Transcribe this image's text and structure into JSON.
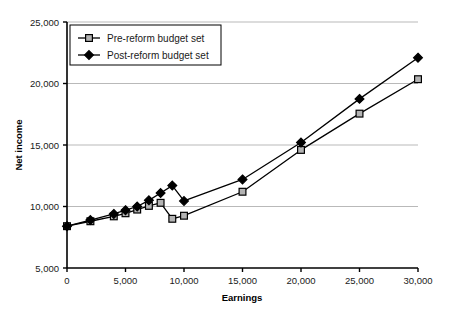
{
  "chart_data": {
    "type": "line",
    "title": "",
    "xlabel": "Earnings",
    "ylabel": "Net income",
    "xlim": [
      0,
      30000
    ],
    "ylim": [
      5000,
      25000
    ],
    "xticks": [
      0,
      5000,
      10000,
      15000,
      20000,
      25000,
      30000
    ],
    "xtick_labels": [
      "0",
      "5,000",
      "10,000",
      "15,000",
      "20,000",
      "25,000",
      "30,000"
    ],
    "yticks": [
      5000,
      10000,
      15000,
      20000,
      25000
    ],
    "ytick_labels": [
      "5,000",
      "10,000",
      "15,000",
      "20,000",
      "25,000"
    ],
    "grid": "horizontal",
    "legend_position": "top-left",
    "series": [
      {
        "name": "Pre-reform budget set",
        "marker": "square",
        "marker_fill": "#b3b3b3",
        "marker_stroke": "#000000",
        "line_color": "#000000",
        "x": [
          0,
          2000,
          4000,
          5000,
          6000,
          7000,
          8000,
          9000,
          10000,
          15000,
          20000,
          25000,
          30000
        ],
        "y": [
          8400,
          8800,
          9200,
          9450,
          9750,
          10050,
          10300,
          9000,
          9250,
          11200,
          14600,
          17550,
          20350
        ]
      },
      {
        "name": "Post-reform budget set",
        "marker": "diamond",
        "marker_fill": "#000000",
        "marker_stroke": "#000000",
        "line_color": "#000000",
        "x": [
          0,
          2000,
          4000,
          5000,
          6000,
          7000,
          8000,
          9000,
          10000,
          15000,
          20000,
          25000,
          30000
        ],
        "y": [
          8400,
          8900,
          9400,
          9700,
          10000,
          10500,
          11100,
          11700,
          10450,
          12200,
          15200,
          18750,
          22100
        ]
      }
    ]
  },
  "legend": {
    "entries": [
      {
        "label": "Pre-reform budget set",
        "marker": "square"
      },
      {
        "label": "Post-reform budget set",
        "marker": "diamond"
      }
    ]
  },
  "colors": {
    "axis": "#000000",
    "gridline": "#b9b9b9",
    "plot_bg": "#ffffff",
    "square_fill": "#b3b3b3",
    "diamond_fill": "#000000",
    "legend_border": "#000000"
  }
}
